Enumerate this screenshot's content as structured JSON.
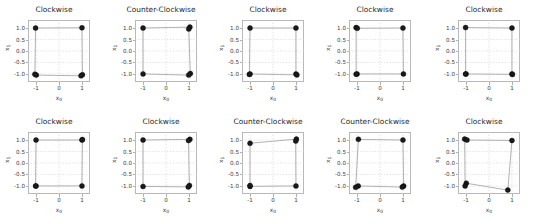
{
  "figure": {
    "rows": 2,
    "cols": 5,
    "background_color": "#ffffff",
    "marker_color": "#1a1a1a",
    "line_color": "#9a9a9a",
    "grid_color": "#cccccc",
    "axis_color": "#b8b8b8"
  },
  "axis": {
    "xlabel": "x₀",
    "ylabel": "x₁",
    "xlabel_base": "x",
    "xlabel_sub": "0",
    "ylabel_base": "x",
    "ylabel_sub": "1",
    "xticks": [
      "-1",
      "0",
      "1"
    ],
    "xtick_values": [
      -1,
      0,
      1
    ],
    "yticks": [
      "1.0",
      "0.5",
      "0.0",
      "-0.5",
      "-1.0"
    ],
    "ytick_values": [
      1.0,
      0.5,
      0.0,
      -0.5,
      -1.0
    ],
    "xlim": [
      -1.35,
      1.35
    ],
    "ylim": [
      -1.35,
      1.35
    ]
  },
  "chart_data": {
    "type": "scatter",
    "title": "",
    "xlabel": "x₀",
    "ylabel": "x₁",
    "xlim": [
      -1.35,
      1.35
    ],
    "ylim": [
      -1.35,
      1.35
    ],
    "grid": true,
    "legend": "none",
    "panel_titles": [
      "Clockwise",
      "Counter-Clockwise",
      "Clockwise",
      "Clockwise",
      "Clockwise",
      "Clockwise",
      "Clockwise",
      "Counter-Clockwise",
      "Counter-Clockwise",
      "Clockwise"
    ],
    "panels": [
      {
        "index": 0,
        "row": 0,
        "col": 0,
        "title": "Clockwise",
        "points": [
          [
            -1.02,
            1.0
          ],
          [
            1.0,
            1.01
          ],
          [
            1.02,
            -1.03
          ],
          [
            0.96,
            -1.08
          ],
          [
            -0.99,
            -1.05
          ],
          [
            -1.05,
            -1.01
          ]
        ],
        "path": [
          [
            -1.02,
            1.0
          ],
          [
            1.0,
            1.01
          ],
          [
            1.02,
            -1.03
          ],
          [
            0.96,
            -1.08
          ],
          [
            -0.99,
            -1.05
          ],
          [
            -1.05,
            -1.01
          ],
          [
            -1.02,
            1.0
          ]
        ]
      },
      {
        "index": 1,
        "row": 0,
        "col": 1,
        "title": "Counter-Clockwise",
        "points": [
          [
            -1.0,
            1.0
          ],
          [
            1.04,
            1.04
          ],
          [
            0.99,
            0.96
          ],
          [
            1.06,
            -0.98
          ],
          [
            0.99,
            -1.05
          ],
          [
            -1.0,
            -1.0
          ]
        ],
        "path": [
          [
            -1.0,
            1.0
          ],
          [
            1.04,
            1.04
          ],
          [
            0.99,
            0.96
          ],
          [
            1.06,
            -0.98
          ],
          [
            0.99,
            -1.05
          ],
          [
            -1.0,
            -1.0
          ],
          [
            -1.0,
            1.0
          ]
        ]
      },
      {
        "index": 2,
        "row": 0,
        "col": 2,
        "title": "Clockwise",
        "points": [
          [
            -1.0,
            1.0
          ],
          [
            1.0,
            1.0
          ],
          [
            1.0,
            -1.0
          ],
          [
            1.04,
            -1.04
          ],
          [
            -1.0,
            -1.0
          ],
          [
            -1.03,
            -1.02
          ]
        ],
        "path": [
          [
            -1.0,
            1.0
          ],
          [
            1.0,
            1.0
          ],
          [
            1.0,
            -1.0
          ],
          [
            1.04,
            -1.04
          ],
          [
            -1.0,
            -1.0
          ],
          [
            -1.03,
            -1.02
          ],
          [
            -1.0,
            1.0
          ]
        ]
      },
      {
        "index": 3,
        "row": 0,
        "col": 3,
        "title": "Clockwise",
        "points": [
          [
            -1.04,
            1.02
          ],
          [
            -0.99,
            0.99
          ],
          [
            1.0,
            1.0
          ],
          [
            1.02,
            -1.0
          ],
          [
            -1.0,
            -1.0
          ],
          [
            -1.04,
            -1.01
          ]
        ],
        "path": [
          [
            -1.04,
            1.02
          ],
          [
            -0.99,
            0.99
          ],
          [
            1.0,
            1.0
          ],
          [
            1.02,
            -1.0
          ],
          [
            -1.0,
            -1.0
          ],
          [
            -1.04,
            -1.01
          ],
          [
            -1.04,
            1.02
          ]
        ]
      },
      {
        "index": 4,
        "row": 0,
        "col": 4,
        "title": "Clockwise",
        "points": [
          [
            -1.02,
            1.02
          ],
          [
            1.0,
            1.0
          ],
          [
            1.0,
            -1.0
          ],
          [
            1.02,
            -1.02
          ],
          [
            -1.0,
            -1.0
          ],
          [
            -1.02,
            -1.0
          ]
        ],
        "path": [
          [
            -1.02,
            1.02
          ],
          [
            1.0,
            1.0
          ],
          [
            1.0,
            -1.0
          ],
          [
            1.02,
            -1.02
          ],
          [
            -1.0,
            -1.0
          ],
          [
            -1.02,
            -1.0
          ],
          [
            -1.02,
            1.02
          ]
        ]
      },
      {
        "index": 5,
        "row": 1,
        "col": 0,
        "title": "Clockwise",
        "points": [
          [
            -1.0,
            1.0
          ],
          [
            1.0,
            1.0
          ],
          [
            1.02,
            1.02
          ],
          [
            1.0,
            -1.0
          ],
          [
            -1.0,
            -1.0
          ],
          [
            -1.02,
            -1.0
          ]
        ],
        "path": [
          [
            -1.0,
            1.0
          ],
          [
            1.0,
            1.0
          ],
          [
            1.02,
            1.02
          ],
          [
            1.0,
            -1.0
          ],
          [
            -1.0,
            -1.0
          ],
          [
            -1.02,
            -1.0
          ],
          [
            -1.0,
            1.0
          ]
        ]
      },
      {
        "index": 6,
        "row": 1,
        "col": 1,
        "title": "Clockwise",
        "points": [
          [
            -1.0,
            1.0
          ],
          [
            1.04,
            1.03
          ],
          [
            0.98,
            0.98
          ],
          [
            1.02,
            -0.98
          ],
          [
            0.97,
            -1.04
          ],
          [
            -1.0,
            -1.02
          ]
        ],
        "path": [
          [
            -1.0,
            1.0
          ],
          [
            1.04,
            1.03
          ],
          [
            0.98,
            0.98
          ],
          [
            1.02,
            -0.98
          ],
          [
            0.97,
            -1.04
          ],
          [
            -1.0,
            -1.02
          ],
          [
            -1.0,
            1.0
          ]
        ]
      },
      {
        "index": 7,
        "row": 1,
        "col": 2,
        "title": "Counter-Clockwise",
        "points": [
          [
            -1.0,
            0.86
          ],
          [
            1.02,
            1.04
          ],
          [
            0.99,
            0.96
          ],
          [
            1.0,
            -1.0
          ],
          [
            -1.0,
            -1.02
          ],
          [
            -1.0,
            -0.98
          ]
        ],
        "path": [
          [
            -1.0,
            0.86
          ],
          [
            1.02,
            1.04
          ],
          [
            0.99,
            0.96
          ],
          [
            1.0,
            -1.0
          ],
          [
            -1.0,
            -1.02
          ],
          [
            -1.0,
            0.86
          ]
        ]
      },
      {
        "index": 8,
        "row": 1,
        "col": 3,
        "title": "Counter-Clockwise",
        "points": [
          [
            -0.94,
            1.03
          ],
          [
            1.0,
            1.0
          ],
          [
            1.03,
            -1.0
          ],
          [
            0.97,
            -1.05
          ],
          [
            -0.95,
            -1.0
          ],
          [
            -1.06,
            -1.06
          ]
        ],
        "path": [
          [
            -0.94,
            1.03
          ],
          [
            1.0,
            1.0
          ],
          [
            1.03,
            -1.0
          ],
          [
            0.97,
            -1.05
          ],
          [
            -0.95,
            -1.0
          ],
          [
            -1.06,
            -1.06
          ],
          [
            -0.94,
            1.03
          ]
        ]
      },
      {
        "index": 9,
        "row": 1,
        "col": 4,
        "title": "Clockwise",
        "points": [
          [
            -1.06,
            1.04
          ],
          [
            -0.96,
            1.0
          ],
          [
            1.0,
            0.98
          ],
          [
            0.82,
            -1.18
          ],
          [
            -0.99,
            -0.88
          ],
          [
            -1.04,
            -1.0
          ]
        ],
        "path": [
          [
            -1.06,
            1.04
          ],
          [
            -0.96,
            1.0
          ],
          [
            1.0,
            0.98
          ],
          [
            0.82,
            -1.18
          ],
          [
            -0.99,
            -0.88
          ],
          [
            -1.04,
            -1.0
          ],
          [
            -1.06,
            1.04
          ]
        ]
      }
    ]
  }
}
